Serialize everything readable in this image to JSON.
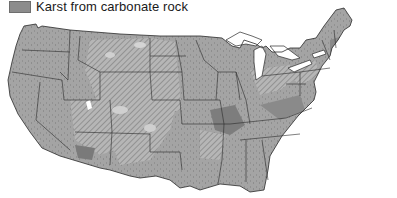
{
  "legend": {
    "items": [
      {
        "label": "Karst from carbonate rock",
        "color": "#8c8c8c"
      }
    ]
  },
  "map": {
    "subject": "Contiguous United States",
    "colors": {
      "land": "#a6a6a6",
      "karst_carbonate": "#8c8c8c",
      "hatched_region": "#b8b8b8",
      "hatch_line": "#6a6a6a",
      "light_patches": "#d2d2d2",
      "state_borders": "#2a2a2a",
      "water": "#ffffff"
    }
  }
}
